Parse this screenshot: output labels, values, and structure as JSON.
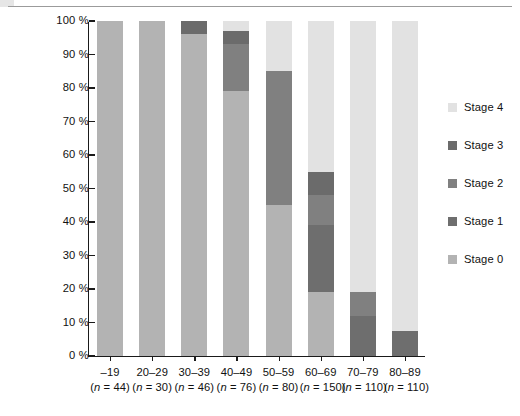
{
  "chart_data": {
    "type": "bar",
    "subtype": "stacked-100-percent",
    "title": "",
    "xlabel": "",
    "ylabel": "",
    "ylim": [
      0,
      100
    ],
    "y_unit": "%",
    "grid": false,
    "legend_position": "right",
    "y_ticks": [
      {
        "value": 100,
        "label": "100 %"
      },
      {
        "value": 90,
        "label": "90 %"
      },
      {
        "value": 80,
        "label": "80 %"
      },
      {
        "value": 70,
        "label": "70 %"
      },
      {
        "value": 60,
        "label": "60 %"
      },
      {
        "value": 50,
        "label": "50 %"
      },
      {
        "value": 40,
        "label": "40 %"
      },
      {
        "value": 30,
        "label": "30 %"
      },
      {
        "value": 20,
        "label": "20 %"
      },
      {
        "value": 10,
        "label": "10 %"
      },
      {
        "value": 0,
        "label": "0 %"
      }
    ],
    "categories": [
      "–19",
      "20–29",
      "30–39",
      "40–49",
      "50–59",
      "60–69",
      "70–79",
      "80–89"
    ],
    "category_sublabels": [
      "(n = 44)",
      "(n = 30)",
      "(n = 46)",
      "(n = 76)",
      "(n = 80)",
      "(n = 150)",
      "(n = 110)",
      "(n = 110)"
    ],
    "category_counts": [
      44,
      30,
      46,
      76,
      80,
      150,
      110,
      110
    ],
    "series": [
      {
        "name": "Stage 0",
        "color": "#b3b3b3",
        "values": [
          100,
          100,
          96,
          79,
          45,
          19,
          0,
          0
        ]
      },
      {
        "name": "Stage 1",
        "color": "#6e6e6e",
        "values": [
          0,
          0,
          0,
          0,
          0,
          20,
          12,
          7.5
        ]
      },
      {
        "name": "Stage 2",
        "color": "#808080",
        "values": [
          0,
          0,
          0,
          14,
          40,
          9,
          7,
          0
        ]
      },
      {
        "name": "Stage 3",
        "color": "#6b6b6b",
        "values": [
          0,
          0,
          4,
          4,
          0,
          7,
          0,
          0
        ]
      },
      {
        "name": "Stage 4",
        "color": "#e2e2e2",
        "values": [
          0,
          0,
          0,
          3,
          15,
          45,
          81,
          92.5
        ]
      }
    ],
    "legend_entries": [
      {
        "label": "Stage 4",
        "color": "#e2e2e2"
      },
      {
        "label": "Stage 3",
        "color": "#6b6b6b"
      },
      {
        "label": "Stage 2",
        "color": "#808080"
      },
      {
        "label": "Stage 1",
        "color": "#6e6e6e"
      },
      {
        "label": "Stage 0",
        "color": "#b3b3b3"
      }
    ],
    "stacks": [
      {
        "category": "–19",
        "segments": [
          {
            "series": "Stage 0",
            "from": 0,
            "to": 100
          }
        ]
      },
      {
        "category": "20–29",
        "segments": [
          {
            "series": "Stage 0",
            "from": 0,
            "to": 100
          }
        ]
      },
      {
        "category": "30–39",
        "segments": [
          {
            "series": "Stage 0",
            "from": 0,
            "to": 96
          },
          {
            "series": "Stage 3",
            "from": 96,
            "to": 100
          }
        ]
      },
      {
        "category": "40–49",
        "segments": [
          {
            "series": "Stage 0",
            "from": 0,
            "to": 79
          },
          {
            "series": "Stage 2",
            "from": 79,
            "to": 93
          },
          {
            "series": "Stage 3",
            "from": 93,
            "to": 97
          },
          {
            "series": "Stage 4",
            "from": 97,
            "to": 100
          }
        ]
      },
      {
        "category": "50–59",
        "segments": [
          {
            "series": "Stage 0",
            "from": 0,
            "to": 45
          },
          {
            "series": "Stage 2",
            "from": 45,
            "to": 85
          },
          {
            "series": "Stage 4",
            "from": 85,
            "to": 100
          }
        ]
      },
      {
        "category": "60–69",
        "segments": [
          {
            "series": "Stage 0",
            "from": 0,
            "to": 19
          },
          {
            "series": "Stage 1",
            "from": 19,
            "to": 39
          },
          {
            "series": "Stage 2",
            "from": 39,
            "to": 48
          },
          {
            "series": "Stage 3",
            "from": 48,
            "to": 55
          },
          {
            "series": "Stage 4",
            "from": 55,
            "to": 100
          }
        ]
      },
      {
        "category": "70–79",
        "segments": [
          {
            "series": "Stage 1",
            "from": 0,
            "to": 12
          },
          {
            "series": "Stage 2",
            "from": 12,
            "to": 19
          },
          {
            "series": "Stage 4",
            "from": 19,
            "to": 100
          }
        ]
      },
      {
        "category": "80–89",
        "segments": [
          {
            "series": "Stage 1",
            "from": 0,
            "to": 7.5
          },
          {
            "series": "Stage 4",
            "from": 7.5,
            "to": 100
          }
        ]
      }
    ]
  },
  "axis": {
    "line_color": "#1a1a1a"
  }
}
